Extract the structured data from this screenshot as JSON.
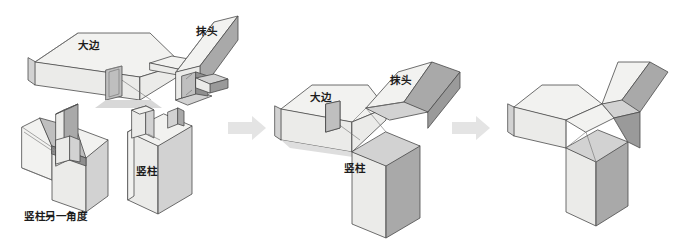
{
  "figure": {
    "title_fragment": "",
    "background": "#ffffff",
    "line_color": "#4a4a4a",
    "arrow_color": "#e2e2e2",
    "face_colors": {
      "top_light": "#f2f2f0",
      "front_light": "#ebebe9",
      "side_mid": "#d2d2d2",
      "side_dark": "#a9a9a9",
      "inner_shadow": "#bfbfbf",
      "deep_dark": "#8f8f8f"
    }
  },
  "stages": [
    {
      "id": "exploded",
      "name": "exploded-parts",
      "parts": [
        {
          "key": "dabian",
          "label": "大边",
          "role": "long-rail",
          "label_pos": {
            "x": 78,
            "y": 45
          }
        },
        {
          "key": "motou",
          "label": "抹头",
          "role": "end-rail",
          "label_pos": {
            "x": 196,
            "y": 31
          }
        },
        {
          "key": "shuzhu-alt",
          "label": "竖柱另一角度",
          "role": "post-alternate-view",
          "label_pos": {
            "x": 22,
            "y": 210
          }
        },
        {
          "key": "shuzhu",
          "label": "竖柱",
          "role": "vertical-post",
          "label_pos": {
            "x": 135,
            "y": 163
          }
        }
      ]
    },
    {
      "id": "assembling",
      "name": "partial-assembly",
      "parts": [
        {
          "key": "dabian",
          "label": "大边",
          "label_pos": {
            "x": 310,
            "y": 93
          }
        },
        {
          "key": "motou",
          "label": "抹头",
          "label_pos": {
            "x": 388,
            "y": 75
          }
        },
        {
          "key": "shuzhu",
          "label": "竖柱",
          "label_pos": {
            "x": 342,
            "y": 163
          }
        }
      ]
    },
    {
      "id": "assembled",
      "name": "finished-joint",
      "parts": []
    }
  ],
  "arrows": [
    {
      "id": "arrow-1",
      "label": "",
      "from": "exploded",
      "to": "assembling",
      "x": 228,
      "y": 118
    },
    {
      "id": "arrow-2",
      "label": "",
      "from": "assembling",
      "to": "assembled",
      "x": 452,
      "y": 118
    }
  ],
  "labels": {
    "dabian": "大边",
    "motou": "抹头",
    "shuzhu": "竖柱",
    "shuzhu_alt": "竖柱另一角度"
  }
}
